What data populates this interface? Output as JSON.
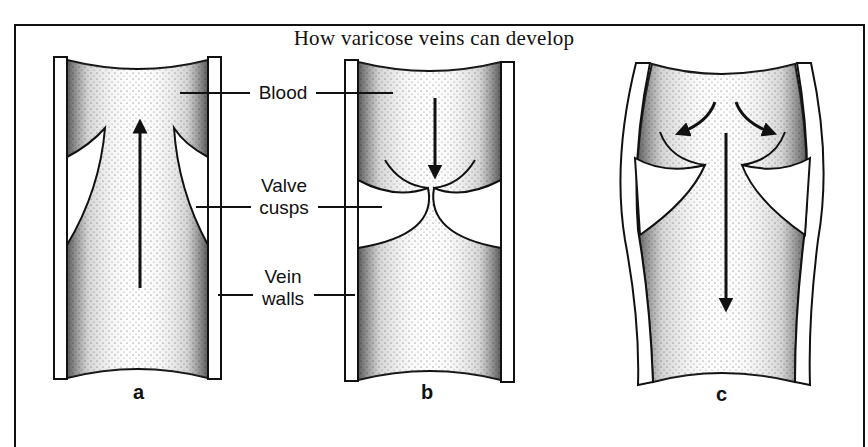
{
  "figure": {
    "title": "How varicose veins can develop",
    "labels": {
      "blood": "Blood",
      "valve_cusps_line1": "Valve",
      "valve_cusps_line2": "cusps",
      "vein_walls_line1": "Vein",
      "vein_walls_line2": "walls"
    },
    "panels": [
      {
        "letter": "a",
        "description": "Normal vein: valve cusps open, blood flows upward"
      },
      {
        "letter": "b",
        "description": "Normal vein: valve cusps close, preventing backflow"
      },
      {
        "letter": "c",
        "description": "Varicose vein: dilated walls, cusps cannot meet, blood flows back downward"
      }
    ],
    "colors": {
      "ink": "#111111",
      "background": "#ffffff",
      "stipple": "#333333"
    }
  }
}
